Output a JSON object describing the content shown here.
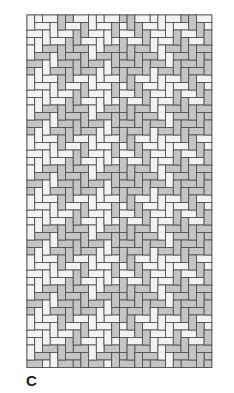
{
  "figure": {
    "label": "C",
    "type": "woven-twill-diagram"
  },
  "weave": {
    "origin_x": 27,
    "origin_y": 15,
    "cols": 24,
    "rows": 47,
    "cell_w": 7.7,
    "cell_h": 7.5,
    "float_length": 2,
    "reverse_every_cols": 12,
    "weft_overhang": 8,
    "colors": {
      "light": "#f2f2f2",
      "gray": "#c4c4c4",
      "stroke": "#4a4a4a"
    },
    "warp_color_sequence": [
      "light",
      "light",
      "light",
      "light",
      "gray",
      "gray",
      "gray",
      "gray",
      "light",
      "light",
      "light",
      "gray",
      "gray",
      "gray",
      "gray",
      "gray",
      "light",
      "light",
      "light",
      "gray",
      "gray",
      "gray",
      "gray",
      "gray"
    ],
    "weft_color_sequence": [
      "light",
      "light",
      "light",
      "light",
      "gray",
      "gray",
      "gray",
      "gray"
    ]
  }
}
